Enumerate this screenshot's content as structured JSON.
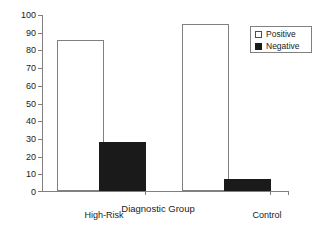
{
  "chart_data": {
    "type": "bar",
    "title": "",
    "xlabel": "Diagnostic Group",
    "ylabel": "",
    "categories": [
      "High-Risk",
      "Control"
    ],
    "series": [
      {
        "name": "Positive",
        "values": [
          86,
          95
        ],
        "color": "#ffffff"
      },
      {
        "name": "Negative",
        "values": [
          28,
          7
        ],
        "color": "#1a1a1a"
      }
    ],
    "ylim": [
      0,
      100
    ],
    "yticks": [
      0,
      10,
      20,
      30,
      40,
      50,
      60,
      70,
      80,
      90,
      100
    ],
    "ytick_labels": [
      "0",
      "10",
      "20",
      "30",
      "40",
      "50",
      "60",
      "70",
      "80",
      "90",
      "100"
    ],
    "grid": false,
    "legend_position": "top-right"
  },
  "legend": {
    "entries": [
      {
        "label": "Positive",
        "swatch": "open-square"
      },
      {
        "label": "Negative",
        "swatch": "filled-square"
      }
    ]
  },
  "axes": {
    "x_title": "Diagnostic Group",
    "x_categories": [
      "High-Risk",
      "Control"
    ],
    "y_labels": [
      "100",
      "90",
      "80",
      "70",
      "60",
      "50",
      "40",
      "30",
      "20",
      "10",
      "0"
    ]
  },
  "colors": {
    "axis": "#808080",
    "text": "#1a1a1a",
    "positive_fill": "#ffffff",
    "negative_fill": "#1a1a1a",
    "background": "#ffffff"
  }
}
